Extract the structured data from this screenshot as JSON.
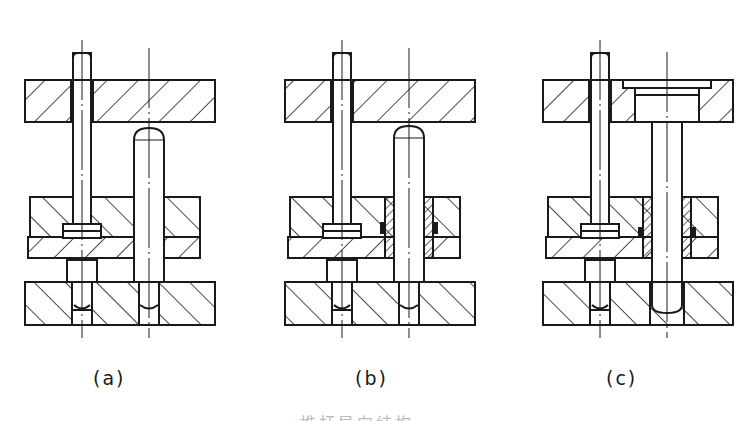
{
  "figure": {
    "subfigures": [
      {
        "id": "a",
        "label": "(a)",
        "state": "ejector pin and guide pillar, guide pillar below top plate"
      },
      {
        "id": "b",
        "label": "(b)",
        "state": "ejector pin and guide pillar with guide bushings in ejector plates"
      },
      {
        "id": "c",
        "label": "(c)",
        "state": "headed guide pillar fixed in top plate, passing through ejector plates"
      }
    ],
    "caption": "推杆导向结构"
  },
  "colors": {
    "line": "#1a1a1a",
    "background": "#ffffff"
  }
}
